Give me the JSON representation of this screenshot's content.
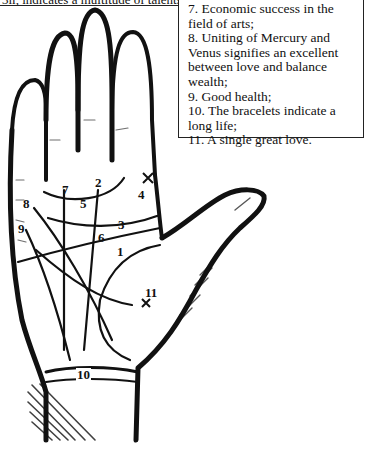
{
  "figure": {
    "top_caption": "3ii, indicates a multitude of talents.",
    "legend": [
      "7. Economic success in the field of arts;",
      "8. Uniting of Mercury and Venus signifies an excellent between love and balance wealth;",
      "9. Good health;",
      "10. The bracelets indicate a long life;",
      "11. A single great love."
    ],
    "line_labels": {
      "l1": "1",
      "l2": "2",
      "l3": "3",
      "l4": "4",
      "l5": "5",
      "l6": "6",
      "l7": "7",
      "l8": "8",
      "l9": "9",
      "l10": "10",
      "l11": "11"
    },
    "markers": {
      "cross_symbol": "×"
    },
    "colors": {
      "ink": "#111111",
      "paper": "#ffffff"
    }
  }
}
